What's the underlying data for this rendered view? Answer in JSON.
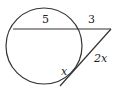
{
  "diagram": {
    "type": "circle-two-secants",
    "colors": {
      "stroke": "#333333",
      "text": "#222222",
      "background": "#ffffff"
    },
    "labels": {
      "chord_top": "5",
      "external_top": "3",
      "external_lower": "2x",
      "chord_lower": "x"
    }
  }
}
